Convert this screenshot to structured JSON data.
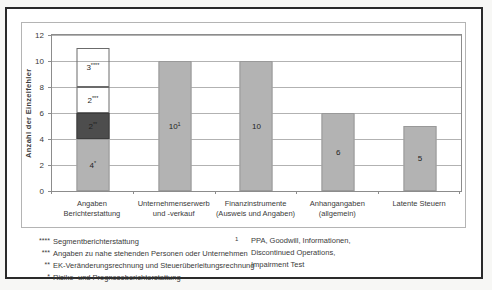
{
  "figure": {
    "footnotes_left": [
      {
        "marker": "****",
        "text": "Segmentberichterstattung"
      },
      {
        "marker": "***",
        "text": "Angaben zu nahe stehenden Personen oder Unternehmen"
      },
      {
        "marker": "**",
        "text": "EK-Veränderungsrechnung und Steuerüberleitungsrechnung"
      },
      {
        "marker": "*",
        "text": "Risiko- und Prognoseberichterstattung"
      }
    ],
    "footnote_right": {
      "marker": "1",
      "lines": [
        "PPA, Goodwill, Informationen,",
        "Discontinued Operations,",
        "Impairment Test"
      ]
    }
  },
  "chart_data": {
    "type": "bar",
    "stacked": true,
    "title": "",
    "xlabel": "",
    "ylabel": "Anzahl der Einzelfehler",
    "ylim": [
      0,
      12
    ],
    "yticks": [
      0,
      2,
      4,
      6,
      8,
      10,
      12
    ],
    "grid": true,
    "legend": "none",
    "colors": {
      "light_fill": "#b3b3b3",
      "light_border": "#999999",
      "dark_fill": "#4d4d4d",
      "dark_border": "#3c3c3c",
      "outline_fill": "transparent",
      "outline_border": "#6b6b6b",
      "grid": "#b2b2b2",
      "axis": "#8c8c8c"
    },
    "categories": [
      {
        "label_lines": [
          "Angaben",
          "Berichterstattung"
        ],
        "total": 11,
        "segments": [
          {
            "value": 4,
            "label": "4",
            "sup": "*",
            "style": "light",
            "meaning": "Risiko- und Prognoseberichterstattung"
          },
          {
            "value": 2,
            "label": "2",
            "sup": "**",
            "style": "dark",
            "meaning": "EK-Veränderungsrechnung und Steuerüberleitungsrechnung"
          },
          {
            "value": 2,
            "label": "2",
            "sup": "***",
            "style": "outline",
            "meaning": "Angaben zu nahe stehenden Personen oder Unternehmen"
          },
          {
            "value": 3,
            "label": "3",
            "sup": "****",
            "style": "outline",
            "meaning": "Segmentberichterstattung"
          }
        ]
      },
      {
        "label_lines": [
          "Unternehmenserwerb",
          "und -verkauf"
        ],
        "total": 10,
        "segments": [
          {
            "value": 10,
            "label": "10",
            "sup": "1",
            "style": "light"
          }
        ]
      },
      {
        "label_lines": [
          "Finanzinstrumente",
          "(Ausweis und Angaben)"
        ],
        "total": 10,
        "segments": [
          {
            "value": 10,
            "label": "10",
            "sup": "",
            "style": "light"
          }
        ]
      },
      {
        "label_lines": [
          "Anhangangaben",
          "(allgemein)"
        ],
        "total": 6,
        "segments": [
          {
            "value": 6,
            "label": "6",
            "sup": "",
            "style": "light"
          }
        ]
      },
      {
        "label_lines": [
          "Latente Steuern"
        ],
        "total": 5,
        "segments": [
          {
            "value": 5,
            "label": "5",
            "sup": "",
            "style": "light"
          }
        ]
      }
    ]
  }
}
